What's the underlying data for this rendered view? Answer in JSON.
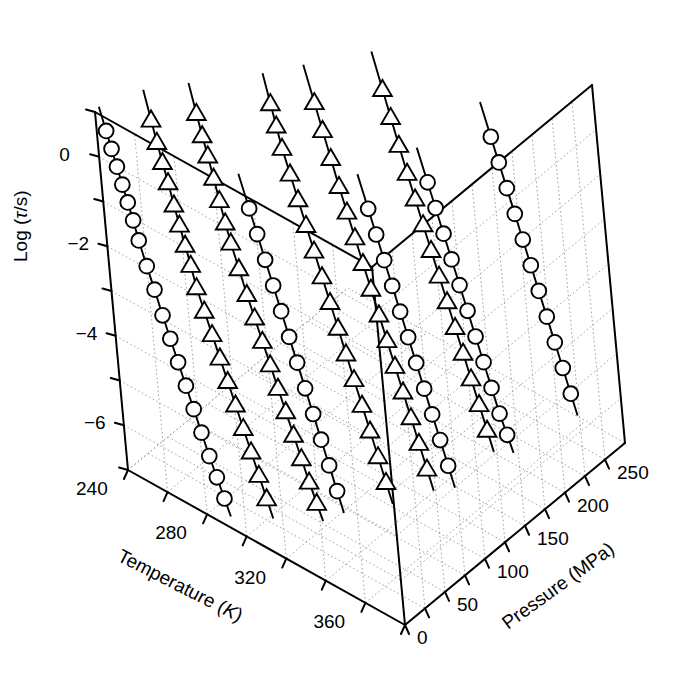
{
  "figure": {
    "type": "3d-scatter-line",
    "background": "#ffffff",
    "ink": "#000000",
    "gridline_color": "#9a9a9a"
  },
  "axes": {
    "z": {
      "label_prefix": "Log (",
      "label_symbol": "τ",
      "label_suffix": "/s)",
      "label_full": "Log (τ/s)",
      "ticks": [
        "0",
        "-2",
        "-4",
        "-6"
      ],
      "tick_values": [
        0,
        -2,
        -4,
        -6
      ],
      "minor_tick_values": [
        1,
        -1,
        -3,
        -5,
        -7
      ],
      "range": [
        -7,
        1
      ]
    },
    "x": {
      "label_prefix": "Temperature (",
      "label_symbol": "K",
      "label_suffix": ")",
      "label_full": "Temperature (K)",
      "ticks": [
        "240",
        "280",
        "320",
        "360"
      ],
      "tick_values": [
        240,
        280,
        320,
        360
      ],
      "range": [
        240,
        380
      ]
    },
    "y": {
      "label_full": "Pressure (MPa)",
      "ticks": [
        "0",
        "50",
        "100",
        "150",
        "200",
        "250"
      ],
      "tick_values": [
        0,
        50,
        100,
        150,
        200,
        250
      ],
      "range": [
        0,
        275
      ]
    }
  },
  "chart_data": {
    "type": "scatter",
    "title": "",
    "xlabel": "Temperature (K)",
    "ylabel": "Pressure (MPa)",
    "zlabel": "Log (τ/s)",
    "xlim": [
      240,
      380
    ],
    "ylim": [
      0,
      275
    ],
    "zlim": [
      -7,
      1
    ],
    "grid": true,
    "legend": "none",
    "markers": [
      "circle-open",
      "triangle-up-open"
    ],
    "series": [
      {
        "name": "isobar-0MPa",
        "marker": "circle-open",
        "pressure": 0,
        "points": [
          {
            "T": 245,
            "logtau": 0.7
          },
          {
            "T": 247,
            "logtau": 0.35
          },
          {
            "T": 249,
            "logtau": 0.0
          },
          {
            "T": 251,
            "logtau": -0.35
          },
          {
            "T": 253,
            "logtau": -0.7
          },
          {
            "T": 255,
            "logtau": -1.05
          },
          {
            "T": 257,
            "logtau": -1.45
          },
          {
            "T": 260,
            "logtau": -1.95
          },
          {
            "T": 263,
            "logtau": -2.4
          },
          {
            "T": 266,
            "logtau": -2.9
          },
          {
            "T": 269,
            "logtau": -3.35
          },
          {
            "T": 272,
            "logtau": -3.8
          },
          {
            "T": 275,
            "logtau": -4.25
          },
          {
            "T": 278,
            "logtau": -4.7
          },
          {
            "T": 281,
            "logtau": -5.15
          },
          {
            "T": 284,
            "logtau": -5.6
          },
          {
            "T": 287,
            "logtau": -6.0
          },
          {
            "T": 290,
            "logtau": -6.4
          }
        ]
      },
      {
        "name": "isobar-25MPa-tri",
        "marker": "triangle-up-open",
        "pressure": 25,
        "points": [
          {
            "T": 258,
            "logtau": 0.9
          },
          {
            "T": 260,
            "logtau": 0.45
          },
          {
            "T": 262,
            "logtau": 0.05
          },
          {
            "T": 264,
            "logtau": -0.35
          },
          {
            "T": 266,
            "logtau": -0.8
          },
          {
            "T": 268,
            "logtau": -1.2
          },
          {
            "T": 270,
            "logtau": -1.6
          },
          {
            "T": 272,
            "logtau": -2.0
          },
          {
            "T": 274,
            "logtau": -2.45
          },
          {
            "T": 277,
            "logtau": -2.9
          },
          {
            "T": 280,
            "logtau": -3.35
          },
          {
            "T": 283,
            "logtau": -3.8
          },
          {
            "T": 286,
            "logtau": -4.25
          },
          {
            "T": 289,
            "logtau": -4.7
          },
          {
            "T": 292,
            "logtau": -5.15
          },
          {
            "T": 295,
            "logtau": -5.6
          },
          {
            "T": 298,
            "logtau": -6.05
          },
          {
            "T": 301,
            "logtau": -6.5
          }
        ]
      },
      {
        "name": "isobar-50MPa-tri",
        "marker": "triangle-up-open",
        "pressure": 50,
        "points": [
          {
            "T": 271,
            "logtau": 1.0
          },
          {
            "T": 273,
            "logtau": 0.55
          },
          {
            "T": 275,
            "logtau": 0.15
          },
          {
            "T": 277,
            "logtau": -0.3
          },
          {
            "T": 279,
            "logtau": -0.75
          },
          {
            "T": 281,
            "logtau": -1.2
          },
          {
            "T": 283,
            "logtau": -1.6
          },
          {
            "T": 286,
            "logtau": -2.1
          },
          {
            "T": 289,
            "logtau": -2.6
          },
          {
            "T": 292,
            "logtau": -3.05
          },
          {
            "T": 295,
            "logtau": -3.5
          },
          {
            "T": 298,
            "logtau": -3.95
          },
          {
            "T": 301,
            "logtau": -4.4
          },
          {
            "T": 304,
            "logtau": -4.85
          },
          {
            "T": 307,
            "logtau": -5.3
          },
          {
            "T": 310,
            "logtau": -5.75
          },
          {
            "T": 313,
            "logtau": -6.2
          },
          {
            "T": 316,
            "logtau": -6.6
          }
        ]
      },
      {
        "name": "isobar-75MPa-circ",
        "marker": "circle-open",
        "pressure": 75,
        "points": [
          {
            "T": 283,
            "logtau": -1.2
          },
          {
            "T": 286,
            "logtau": -1.7
          },
          {
            "T": 289,
            "logtau": -2.2
          },
          {
            "T": 292,
            "logtau": -2.7
          },
          {
            "T": 295,
            "logtau": -3.2
          },
          {
            "T": 298,
            "logtau": -3.7
          },
          {
            "T": 301,
            "logtau": -4.2
          },
          {
            "T": 304,
            "logtau": -4.7
          },
          {
            "T": 307,
            "logtau": -5.2
          },
          {
            "T": 310,
            "logtau": -5.7
          },
          {
            "T": 313,
            "logtau": -6.2
          },
          {
            "T": 316,
            "logtau": -6.7
          }
        ]
      },
      {
        "name": "isobar-100MPa-tri",
        "marker": "triangle-up-open",
        "pressure": 100,
        "points": [
          {
            "T": 288,
            "logtau": 0.9
          },
          {
            "T": 290,
            "logtau": 0.45
          },
          {
            "T": 292,
            "logtau": 0.0
          },
          {
            "T": 295,
            "logtau": -0.5
          },
          {
            "T": 298,
            "logtau": -1.0
          },
          {
            "T": 301,
            "logtau": -1.5
          },
          {
            "T": 304,
            "logtau": -2.0
          },
          {
            "T": 307,
            "logtau": -2.5
          },
          {
            "T": 310,
            "logtau": -3.0
          },
          {
            "T": 313,
            "logtau": -3.5
          },
          {
            "T": 316,
            "logtau": -4.0
          },
          {
            "T": 319,
            "logtau": -4.5
          },
          {
            "T": 322,
            "logtau": -5.0
          },
          {
            "T": 325,
            "logtau": -5.5
          },
          {
            "T": 328,
            "logtau": -6.0
          },
          {
            "T": 331,
            "logtau": -6.5
          }
        ]
      },
      {
        "name": "isobar-125MPa-tri",
        "marker": "triangle-up-open",
        "pressure": 125,
        "points": [
          {
            "T": 300,
            "logtau": 0.85
          },
          {
            "T": 303,
            "logtau": 0.3
          },
          {
            "T": 306,
            "logtau": -0.25
          },
          {
            "T": 309,
            "logtau": -0.8
          },
          {
            "T": 312,
            "logtau": -1.3
          },
          {
            "T": 315,
            "logtau": -1.8
          },
          {
            "T": 318,
            "logtau": -2.3
          },
          {
            "T": 321,
            "logtau": -2.8
          },
          {
            "T": 324,
            "logtau": -3.3
          },
          {
            "T": 327,
            "logtau": -3.8
          },
          {
            "T": 330,
            "logtau": -4.3
          },
          {
            "T": 333,
            "logtau": -4.8
          },
          {
            "T": 336,
            "logtau": -5.3
          },
          {
            "T": 339,
            "logtau": -5.8
          },
          {
            "T": 342,
            "logtau": -6.3
          }
        ]
      },
      {
        "name": "isobar-150MPa-circ",
        "marker": "circle-open",
        "pressure": 150,
        "points": [
          {
            "T": 312,
            "logtau": -1.6
          },
          {
            "T": 315,
            "logtau": -2.1
          },
          {
            "T": 318,
            "logtau": -2.6
          },
          {
            "T": 321,
            "logtau": -3.1
          },
          {
            "T": 324,
            "logtau": -3.6
          },
          {
            "T": 327,
            "logtau": -4.1
          },
          {
            "T": 330,
            "logtau": -4.6
          },
          {
            "T": 333,
            "logtau": -5.1
          },
          {
            "T": 336,
            "logtau": -5.6
          },
          {
            "T": 339,
            "logtau": -6.1
          },
          {
            "T": 342,
            "logtau": -6.6
          }
        ]
      },
      {
        "name": "isobar-175MPa-tri",
        "marker": "triangle-up-open",
        "pressure": 175,
        "points": [
          {
            "T": 314,
            "logtau": 0.75
          },
          {
            "T": 317,
            "logtau": 0.2
          },
          {
            "T": 320,
            "logtau": -0.35
          },
          {
            "T": 323,
            "logtau": -0.9
          },
          {
            "T": 326,
            "logtau": -1.4
          },
          {
            "T": 329,
            "logtau": -1.9
          },
          {
            "T": 332,
            "logtau": -2.4
          },
          {
            "T": 335,
            "logtau": -2.9
          },
          {
            "T": 338,
            "logtau": -3.4
          },
          {
            "T": 341,
            "logtau": -3.9
          },
          {
            "T": 344,
            "logtau": -4.4
          },
          {
            "T": 347,
            "logtau": -4.9
          },
          {
            "T": 350,
            "logtau": -5.4
          },
          {
            "T": 353,
            "logtau": -5.9
          }
        ]
      },
      {
        "name": "isobar-200MPa-circ",
        "marker": "circle-open",
        "pressure": 200,
        "points": [
          {
            "T": 322,
            "logtau": -1.5
          },
          {
            "T": 325,
            "logtau": -2.0
          },
          {
            "T": 328,
            "logtau": -2.5
          },
          {
            "T": 331,
            "logtau": -3.0
          },
          {
            "T": 334,
            "logtau": -3.5
          },
          {
            "T": 337,
            "logtau": -4.0
          },
          {
            "T": 340,
            "logtau": -4.5
          },
          {
            "T": 343,
            "logtau": -5.0
          },
          {
            "T": 346,
            "logtau": -5.5
          },
          {
            "T": 349,
            "logtau": -6.0
          },
          {
            "T": 352,
            "logtau": -6.4
          }
        ]
      },
      {
        "name": "isobar-250MPa-circ",
        "marker": "circle-open",
        "pressure": 250,
        "points": [
          {
            "T": 335,
            "logtau": -0.9
          },
          {
            "T": 338,
            "logtau": -1.4
          },
          {
            "T": 341,
            "logtau": -1.9
          },
          {
            "T": 344,
            "logtau": -2.4
          },
          {
            "T": 347,
            "logtau": -2.9
          },
          {
            "T": 350,
            "logtau": -3.4
          },
          {
            "T": 353,
            "logtau": -3.9
          },
          {
            "T": 356,
            "logtau": -4.4
          },
          {
            "T": 359,
            "logtau": -4.9
          },
          {
            "T": 362,
            "logtau": -5.4
          },
          {
            "T": 365,
            "logtau": -5.9
          }
        ]
      }
    ]
  }
}
